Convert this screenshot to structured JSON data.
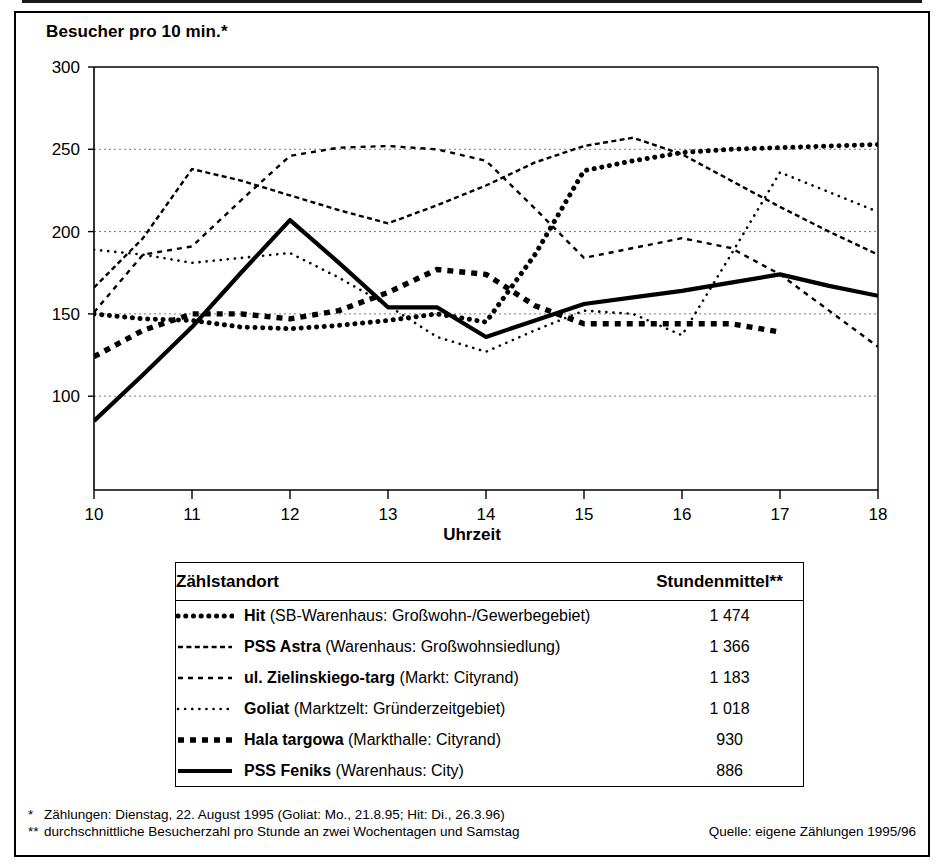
{
  "axis_title_y": "Besucher pro 10 min.*",
  "axis_title_x": "Uhrzeit",
  "legend_table": {
    "header_location": "Zählstandort",
    "header_mean": "Stundenmittel**",
    "rows": [
      {
        "style": "dotted-round",
        "name": "Hit",
        "desc": "(SB-Warenhaus: Großwohn-/Gewerbegebiet)",
        "mean": "1 474"
      },
      {
        "style": "zigzag",
        "name": "PSS Astra",
        "desc": "(Warenhaus: Großwohnsiedlung)",
        "mean": "1 366"
      },
      {
        "style": "backslash",
        "name": "ul. Zielinskiego-targ",
        "desc": "(Markt: Cityrand)",
        "mean": "1 183"
      },
      {
        "style": "fine-dotted",
        "name": "Goliat",
        "desc": "(Marktzelt: Gründerzeitgebiet)",
        "mean": "1 018"
      },
      {
        "style": "square-dash",
        "name": "Hala targowa",
        "desc": "(Markthalle: Cityrand)",
        "mean": "930"
      },
      {
        "style": "solid",
        "name": "PSS Feniks",
        "desc": "(Warenhaus: City)",
        "mean": "886"
      }
    ]
  },
  "footnotes": {
    "mark1": "*",
    "line1": "Zählungen: Dienstag, 22. August 1995 (Goliat: Mo., 21.8.95; Hit: Di., 26.3.96)",
    "mark2": "**",
    "line2": "durchschnittliche Besucherzahl pro Stunde an zwei Wochentagen und Samstag",
    "source": "Quelle: eigene Zählungen 1995/96"
  },
  "chart_data": {
    "type": "line",
    "title": "",
    "xlabel": "Uhrzeit",
    "ylabel": "Besucher pro 10 min.*",
    "xlim": [
      10,
      18
    ],
    "ylim": [
      43,
      300
    ],
    "yticks": [
      100,
      150,
      200,
      250,
      300
    ],
    "xticks": [
      10,
      11,
      12,
      13,
      14,
      15,
      16,
      17,
      18
    ],
    "grid": "horizontal-dotted",
    "legend_position": "table-below",
    "x": [
      10,
      10.5,
      11,
      11.5,
      12,
      12.5,
      13,
      13.5,
      14,
      14.5,
      15,
      15.5,
      16,
      16.5,
      17,
      17.5,
      18
    ],
    "series": [
      {
        "name": "Hit",
        "style": "dotted-round",
        "values": [
          150,
          147,
          146,
          142,
          141,
          143,
          146,
          150,
          145,
          186,
          237,
          243,
          248,
          250,
          251,
          252,
          253
        ]
      },
      {
        "name": "PSS Astra",
        "style": "zigzag",
        "values": [
          166,
          196,
          238,
          231,
          222,
          213,
          205,
          216,
          228,
          242,
          252,
          257,
          247,
          231,
          215,
          200,
          186
        ]
      },
      {
        "name": "ul. Zielinskiego-targ",
        "style": "backslash",
        "values": [
          151,
          186,
          191,
          219,
          246,
          251,
          252,
          250,
          243,
          214,
          184,
          190,
          196,
          190,
          174,
          152,
          130
        ]
      },
      {
        "name": "Goliat",
        "style": "fine-dotted",
        "values": [
          189,
          186,
          181,
          184,
          187,
          172,
          155,
          136,
          127,
          140,
          152,
          150,
          137,
          186,
          236,
          224,
          212
        ]
      },
      {
        "name": "Hala targowa",
        "style": "square-dash",
        "values": [
          124,
          140,
          150,
          150,
          147,
          152,
          163,
          177,
          174,
          155,
          144,
          144,
          144,
          144,
          139,
          null,
          null
        ]
      },
      {
        "name": "PSS Feniks",
        "style": "solid",
        "values": [
          85,
          113,
          142,
          175,
          207,
          181,
          154,
          154,
          136,
          146,
          156,
          160,
          164,
          169,
          174,
          167,
          161
        ]
      }
    ]
  }
}
